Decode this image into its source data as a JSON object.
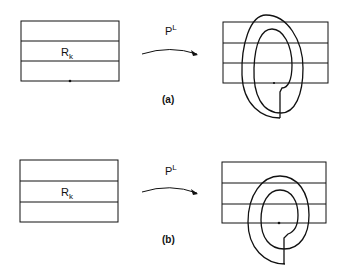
{
  "figure": {
    "panels": [
      {
        "id": "a",
        "caption": "(a)",
        "region_label": "R",
        "region_subscript": "k",
        "map_label": "P",
        "map_superscript": "L"
      },
      {
        "id": "b",
        "caption": "(b)",
        "region_label": "R",
        "region_subscript": "k",
        "map_label": "P",
        "map_superscript": "L"
      }
    ],
    "colors": {
      "stroke": "#111111",
      "background": "#ffffff"
    }
  }
}
